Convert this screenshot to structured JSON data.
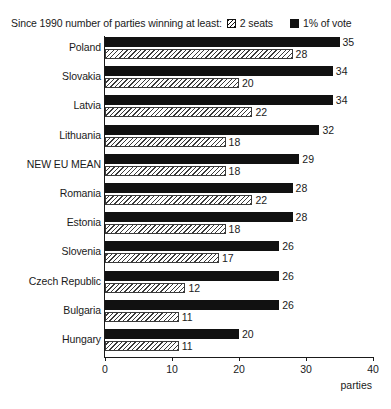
{
  "legend": {
    "prompt": "Since 1990 number of parties winning at least:",
    "entries": [
      {
        "label": "2 seats",
        "swatch": "hatched-square-icon",
        "color": "#111111"
      },
      {
        "label": "1% of vote",
        "swatch": "filled-square-icon",
        "color": "#111111"
      }
    ]
  },
  "axis": {
    "x_title": "parties",
    "ticks": [
      "0",
      "10",
      "20",
      "30",
      "40"
    ]
  },
  "caption": "",
  "chart_data": {
    "type": "bar",
    "orientation": "horizontal",
    "title": "",
    "subtitle": "",
    "xlabel": "parties",
    "ylabel": "",
    "xlim": [
      0,
      40
    ],
    "xticks": [
      0,
      10,
      20,
      30,
      40
    ],
    "grid": false,
    "legend_position": "top",
    "categories": [
      "Poland",
      "Slovakia",
      "Latvia",
      "Lithuania",
      "NEW EU MEAN",
      "Romania",
      "Estonia",
      "Slovenia",
      "Czech Republic",
      "Bulgaria",
      "Hungary"
    ],
    "series": [
      {
        "name": "1% of vote",
        "style": "solid-black",
        "color": "#111111",
        "values": [
          35,
          34,
          34,
          32,
          29,
          28,
          28,
          26,
          26,
          26,
          20
        ]
      },
      {
        "name": "2 seats",
        "style": "diagonal-hatch",
        "color": "#3a3a3a",
        "values": [
          28,
          20,
          22,
          18,
          18,
          22,
          18,
          17,
          12,
          11,
          11
        ]
      }
    ]
  }
}
